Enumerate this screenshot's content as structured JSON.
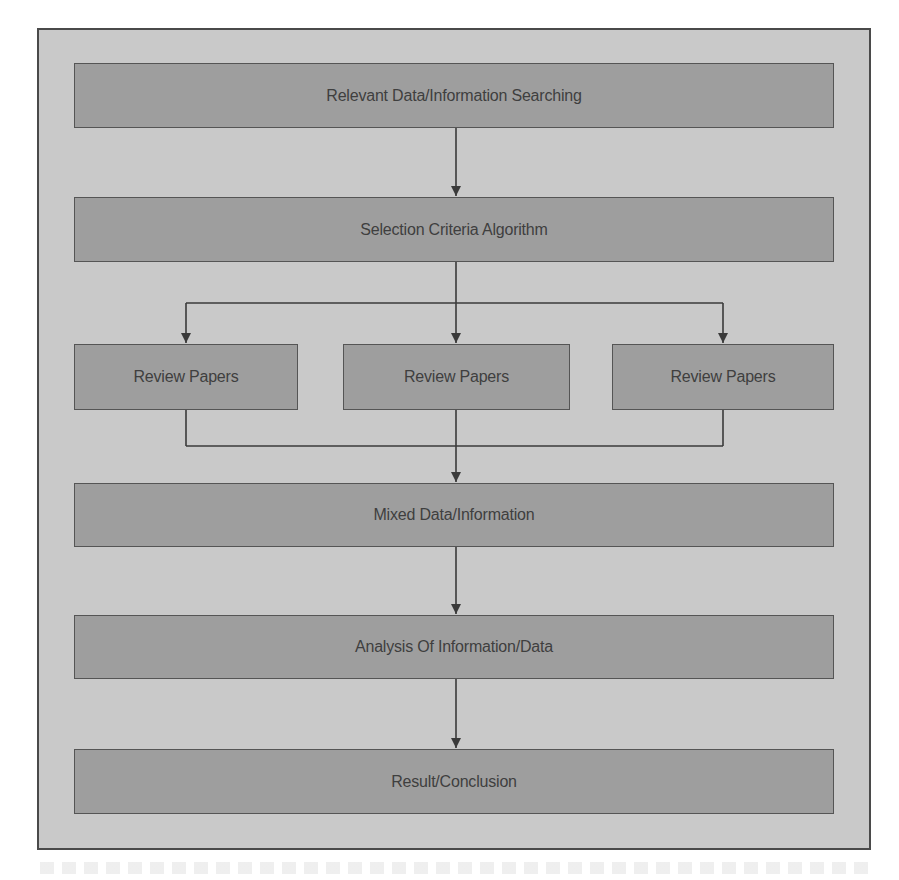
{
  "diagram": {
    "type": "flowchart",
    "colors": {
      "frame_background": "#c9c9c9",
      "frame_border": "#4a4a4a",
      "box_fill": "#9e9e9e",
      "box_border": "#555555",
      "text": "#3f3f3f",
      "connector": "#3a3a3a"
    },
    "nodes": [
      {
        "id": "search",
        "label": "Relevant Data/Information Searching"
      },
      {
        "id": "selection",
        "label": "Selection Criteria Algorithm"
      },
      {
        "id": "review1",
        "label": "Review Papers"
      },
      {
        "id": "review2",
        "label": "Review Papers"
      },
      {
        "id": "review3",
        "label": "Review Papers"
      },
      {
        "id": "mixed",
        "label": "Mixed Data/Information"
      },
      {
        "id": "analysis",
        "label": "Analysis Of Information/Data"
      },
      {
        "id": "result",
        "label": "Result/Conclusion"
      }
    ],
    "edges": [
      {
        "from": "search",
        "to": "selection"
      },
      {
        "from": "selection",
        "to": "review1"
      },
      {
        "from": "selection",
        "to": "review2"
      },
      {
        "from": "selection",
        "to": "review3"
      },
      {
        "from": "review1",
        "to": "mixed"
      },
      {
        "from": "review2",
        "to": "mixed"
      },
      {
        "from": "review3",
        "to": "mixed"
      },
      {
        "from": "mixed",
        "to": "analysis"
      },
      {
        "from": "analysis",
        "to": "result"
      }
    ]
  }
}
